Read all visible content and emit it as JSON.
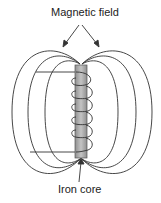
{
  "diagram": {
    "type": "electromagnet",
    "labels": {
      "top": "Magnetic field",
      "bottom": "Iron core"
    },
    "components": [
      "iron-core",
      "coil",
      "wire-leads",
      "magnetic-field-lines"
    ],
    "field_line_count_per_side": 3,
    "coil_turns": 6,
    "colors": {
      "line": "#333333",
      "core_fill": "#a9a9a9",
      "background": "#ffffff"
    }
  }
}
